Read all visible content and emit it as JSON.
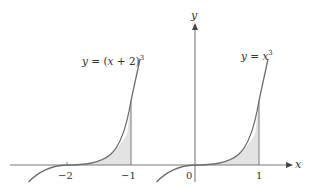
{
  "figure": {
    "axes": {
      "x_label": "x",
      "y_label": "y",
      "origin_label": "0"
    },
    "ticks": [
      {
        "value": -2,
        "label": "−2"
      },
      {
        "value": -1,
        "label": "−1"
      },
      {
        "value": 1,
        "label": "1"
      }
    ],
    "curves": [
      {
        "name": "shifted-cube",
        "equation_prefix": "y = (",
        "equation_var": "x",
        "equation_mid": " + 2)",
        "exponent": "3",
        "shaded_from": -2,
        "shaded_to": -1
      },
      {
        "name": "cube",
        "equation_prefix": "y = ",
        "equation_var": "x",
        "exponent": "3",
        "shaded_from": 0,
        "shaded_to": 1
      }
    ],
    "colors": {
      "curve": "#6e6e6e",
      "axis": "#7a7a7a",
      "shade": "#e3e3e3",
      "text": "#333333"
    }
  }
}
